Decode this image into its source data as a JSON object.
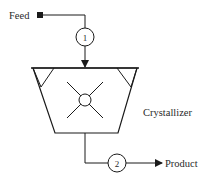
{
  "diagram": {
    "type": "process-flow",
    "colors": {
      "stroke": "#1a1a1a",
      "text": "#2a2a2a",
      "background": "#ffffff"
    },
    "nodes": {
      "feed": {
        "label": "Feed"
      },
      "stream1": {
        "label": "1"
      },
      "crystallizer": {
        "label": "Crystallizer"
      },
      "stream2": {
        "label": "2"
      },
      "product": {
        "label": "Product"
      }
    },
    "edges": [
      {
        "from": "Feed",
        "to": "Crystallizer",
        "stream": "1"
      },
      {
        "from": "Crystallizer",
        "to": "Product",
        "stream": "2"
      }
    ]
  }
}
